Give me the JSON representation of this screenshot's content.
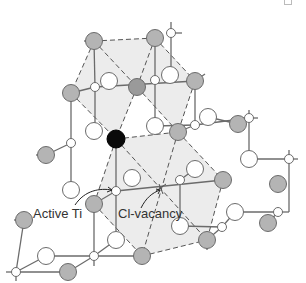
{
  "diagram": {
    "labels": {
      "active_ti": "Active Ti",
      "cl_vacancy": "Cl-vacancy"
    },
    "colors": {
      "shaded_region": "#ececec",
      "gray_atom": "#b4b4b4",
      "dark_gray_atom": "#9a9a9a",
      "white_atom": "#ffffff",
      "active_ti": "#0a0a0a",
      "outline": "#6b6b6b"
    },
    "legend_items": [
      {
        "name": "Active Ti",
        "marker": "black-filled-circle"
      },
      {
        "name": "Cl-vacancy",
        "marker": "empty-lattice-position"
      }
    ]
  }
}
